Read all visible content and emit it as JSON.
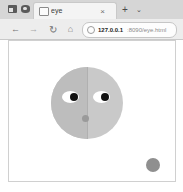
{
  "window": {
    "title": "eye"
  },
  "tabstrip": {
    "system_icons": [
      {
        "name": "sidebar-toggle-icon",
        "glyph": ""
      },
      {
        "name": "tab-overview-icon",
        "glyph": ""
      }
    ],
    "tabs": [
      {
        "label": "eye",
        "favicon": "page-icon",
        "close_label": "×",
        "active": true
      }
    ],
    "new_tab_label": "+",
    "tab_list_label": "⌄"
  },
  "navbar": {
    "back_label": "←",
    "forward_label": "→",
    "reload_label": "↻",
    "home_label": "⌂",
    "url": {
      "info_icon": "site-info-icon",
      "host": "127.0.0.1",
      "path": ":8090/eye.html",
      "placeholder": "Search or enter address"
    }
  },
  "page": {
    "face": {
      "label": "eye-tracking-face",
      "fill_color": "#c9c9c9",
      "left_half_color": "#bdbdbd",
      "divider_color": "#b0b0b0",
      "eye_white_color": "#ffffff",
      "pupil_color": "#111111",
      "mouth_color": "#9a9a9a"
    },
    "cursor": {
      "label": "cursor-target-dot",
      "color": "#8f8f8f",
      "x": 137,
      "y": 117
    },
    "background_color": "#ffffff"
  }
}
